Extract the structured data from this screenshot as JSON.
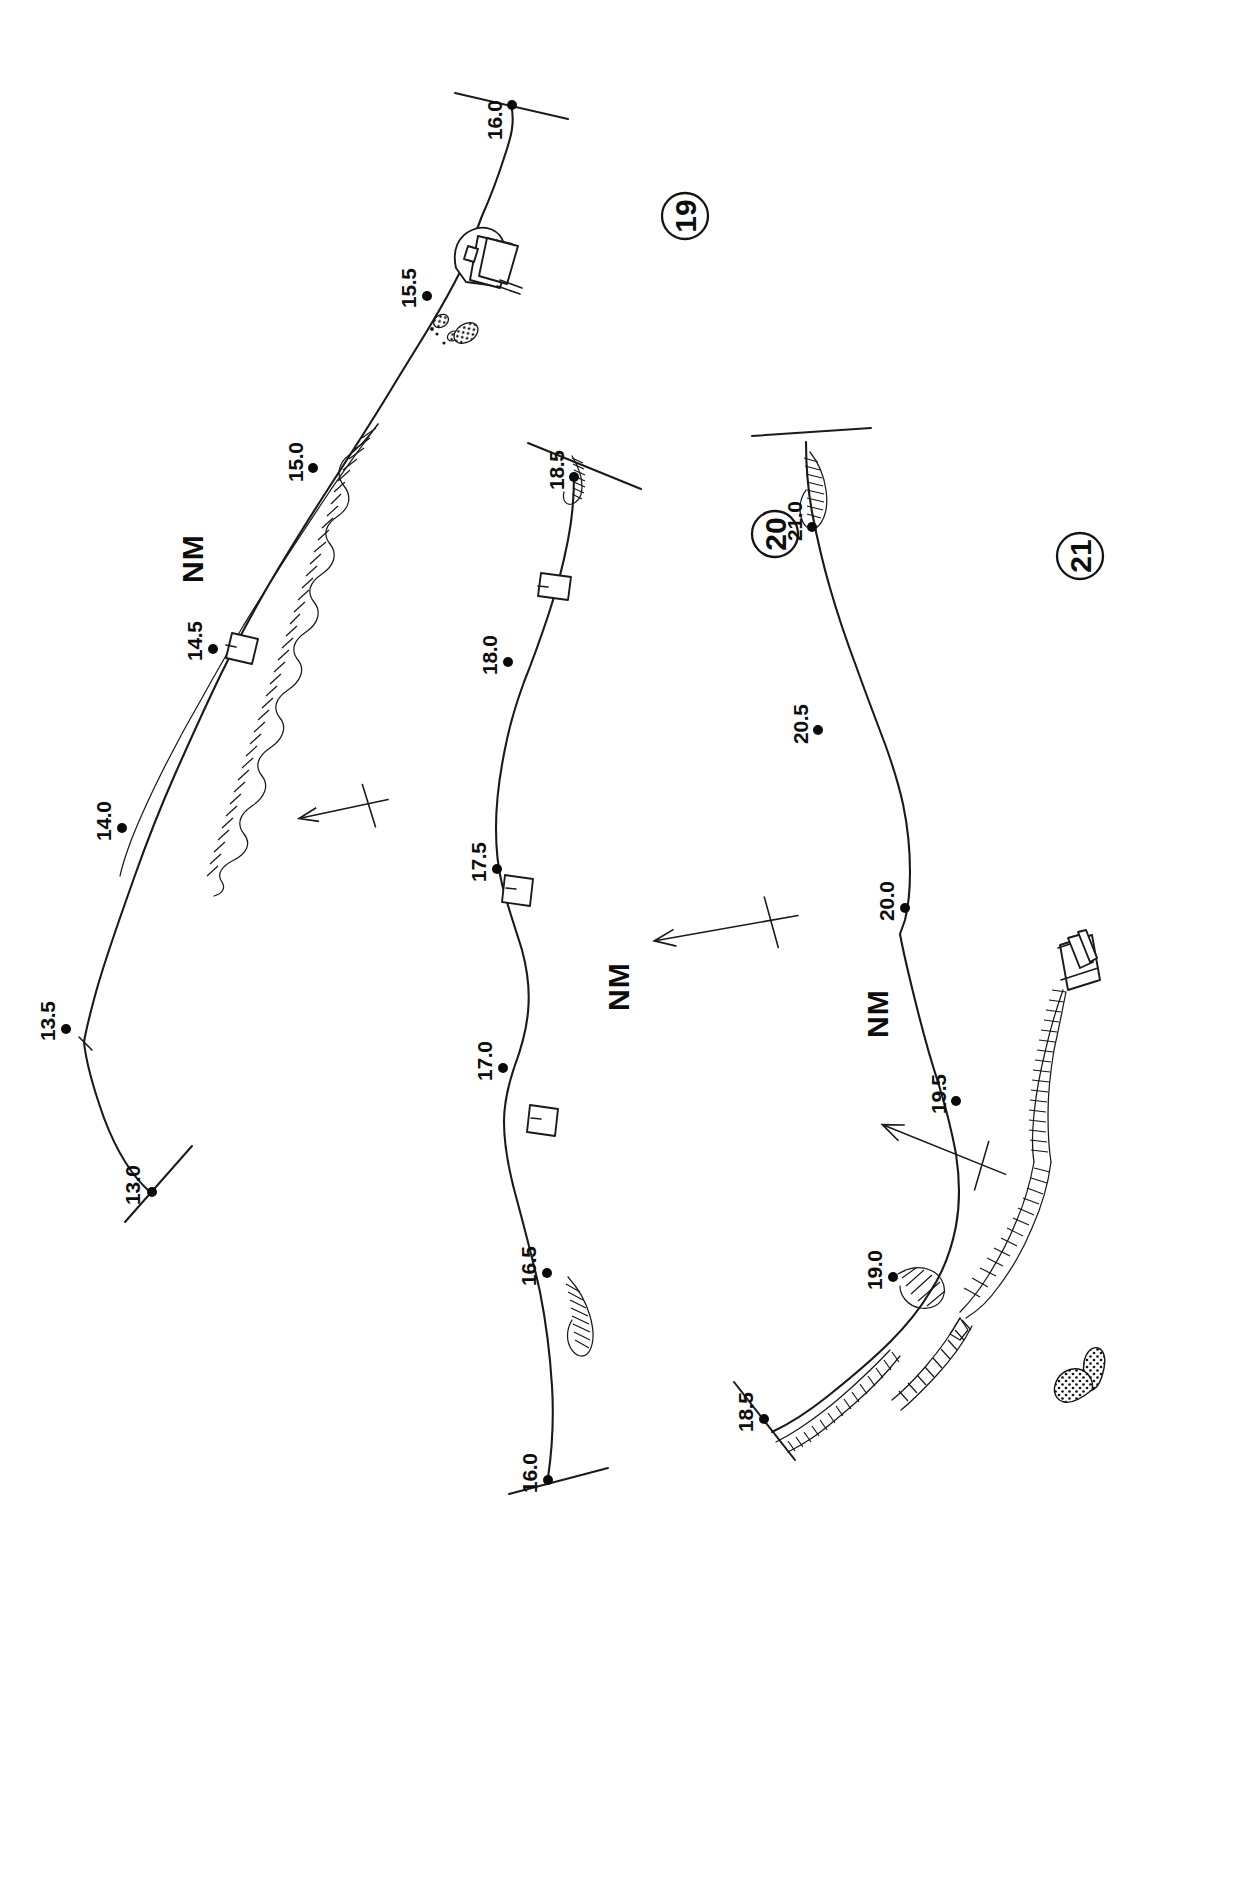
{
  "document": {
    "title": "River Navigation Survey — Sheets 19, 20, 21",
    "orientation": "landscape-rotated-90",
    "background_color": "#ffffff",
    "ink_color": "#111111"
  },
  "sheets": [
    {
      "id": "sheet-19",
      "number": "19",
      "north_label": "NM",
      "circle_center": {
        "x": 685,
        "y": 216
      },
      "nm_label_position": {
        "x": 203,
        "y": 583
      },
      "chainage_markers": [
        {
          "label": "16.0",
          "x": 512,
          "y": 105,
          "has_cross_section": true
        },
        {
          "label": "15.5",
          "x": 427,
          "y": 296,
          "has_cross_section": false
        },
        {
          "label": "15.0",
          "x": 313,
          "y": 468,
          "has_cross_section": false
        },
        {
          "label": "14.5",
          "x": 213,
          "y": 649,
          "has_cross_section": false
        },
        {
          "label": "14.0",
          "x": 122,
          "y": 828,
          "has_cross_section": false
        },
        {
          "label": "13.5",
          "x": 66,
          "y": 1029,
          "has_cross_section": false
        },
        {
          "label": "13.0",
          "x": 152,
          "y": 1192,
          "has_cross_section": true
        }
      ],
      "features": [
        "hatched-embankment",
        "bridge-structure",
        "stipple-shoal",
        "lock-chamber"
      ]
    },
    {
      "id": "sheet-20",
      "number": "20",
      "north_label": "NM",
      "circle_center": {
        "x": 775,
        "y": 534
      },
      "nm_label_position": {
        "x": 629,
        "y": 1011
      },
      "chainage_markers": [
        {
          "label": "18.5",
          "x": 574,
          "y": 477,
          "has_cross_section": true
        },
        {
          "label": "18.0",
          "x": 508,
          "y": 662,
          "has_cross_section": false
        },
        {
          "label": "17.5",
          "x": 497,
          "y": 869,
          "has_cross_section": false
        },
        {
          "label": "17.0",
          "x": 503,
          "y": 1068,
          "has_cross_section": false
        },
        {
          "label": "16.5",
          "x": 547,
          "y": 1273,
          "has_cross_section": false
        },
        {
          "label": "16.0",
          "x": 548,
          "y": 1480,
          "has_cross_section": true
        }
      ],
      "features": [
        "hatched-embankment",
        "lock-chamber",
        "north-arrow"
      ]
    },
    {
      "id": "sheet-21",
      "number": "21",
      "north_label": "NM",
      "circle_center": {
        "x": 1080,
        "y": 556
      },
      "nm_label_position": {
        "x": 888,
        "y": 1038
      },
      "chainage_markers": [
        {
          "label": "21.0",
          "x": 812,
          "y": 527,
          "has_cross_section": true
        },
        {
          "label": "20.5",
          "x": 818,
          "y": 730,
          "has_cross_section": false
        },
        {
          "label": "20.0",
          "x": 905,
          "y": 908,
          "has_cross_section": false
        },
        {
          "label": "19.5",
          "x": 956,
          "y": 1101,
          "has_cross_section": false
        },
        {
          "label": "19.0",
          "x": 893,
          "y": 1277,
          "has_cross_section": false
        },
        {
          "label": "18.5",
          "x": 764,
          "y": 1419,
          "has_cross_section": true
        }
      ],
      "features": [
        "hatched-embankment",
        "bridge-structure",
        "stipple-island",
        "north-arrow"
      ]
    }
  ],
  "north_arrows": [
    {
      "id": "north-arrow-1",
      "x": 300,
      "y": 810,
      "angle": -12,
      "label": ""
    },
    {
      "id": "north-arrow-2",
      "x": 655,
      "y": 930,
      "angle": -10,
      "label": ""
    },
    {
      "id": "north-arrow-3",
      "x": 880,
      "y": 1150,
      "angle": -28,
      "label": ""
    }
  ],
  "legend": {
    "nm_meaning": "NM",
    "units": "",
    "note": ""
  }
}
